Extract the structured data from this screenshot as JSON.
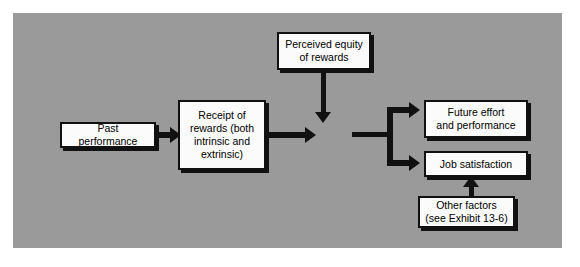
{
  "diagram": {
    "background_color": "#9a9a9a",
    "node_fill_color": "#fbfbfb",
    "line_color": "#111111",
    "nodes": [
      {
        "id": "past-performance",
        "label": "Past performance"
      },
      {
        "id": "receipt-rewards",
        "label": "Receipt of\nrewards (both\nintrinsic and\nextrinsic)"
      },
      {
        "id": "perceived-equity",
        "label": "Perceived equity\nof rewards"
      },
      {
        "id": "future-effort",
        "label": "Future effort\nand performance"
      },
      {
        "id": "job-satisfaction",
        "label": "Job satisfaction"
      },
      {
        "id": "other-factors",
        "label": "Other factors\n(see Exhibit 13-6)"
      }
    ],
    "edges": [
      {
        "id": "past-to-receipt",
        "from": "past-performance",
        "to": "receipt-rewards",
        "direction": "right"
      },
      {
        "id": "receipt-to-merge",
        "from": "receipt-rewards",
        "to": "merge-point",
        "direction": "right"
      },
      {
        "id": "equity-to-merge",
        "from": "perceived-equity",
        "to": "merge-point",
        "direction": "down"
      },
      {
        "id": "merge-to-split",
        "from": "merge-point",
        "to": "split-bar",
        "direction": "right"
      },
      {
        "id": "split-to-future",
        "from": "split-bar",
        "to": "future-effort",
        "direction": "right"
      },
      {
        "id": "split-to-job",
        "from": "split-bar",
        "to": "job-satisfaction",
        "direction": "right"
      },
      {
        "id": "other-to-job",
        "from": "other-factors",
        "to": "job-satisfaction",
        "direction": "up"
      }
    ]
  }
}
